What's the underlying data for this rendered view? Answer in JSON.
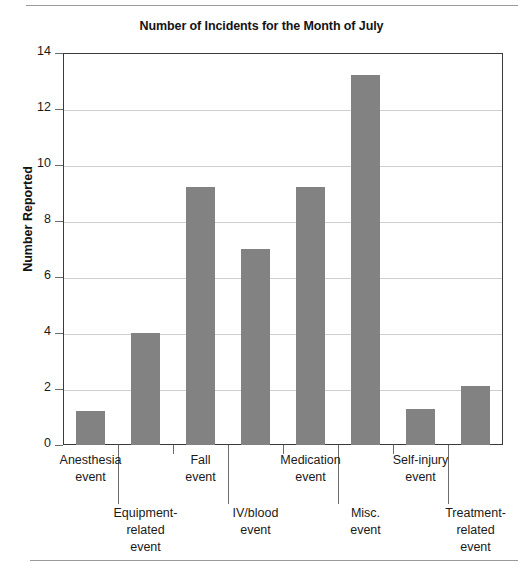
{
  "figure": {
    "title": "Number of Incidents for the Month of July",
    "y_axis_title": "Number Reported",
    "bar_color": "#828282",
    "grid_color": "#cfcfcf",
    "frame_color": "#3a3a3a"
  },
  "chart_data": {
    "type": "bar",
    "title": "Number of Incidents for the Month of July",
    "xlabel": "",
    "ylabel": "Number Reported",
    "ylim": [
      0,
      14
    ],
    "yticks": [
      0,
      2,
      4,
      6,
      8,
      10,
      12,
      14
    ],
    "ytick_labels": [
      "0",
      "2",
      "4",
      "6",
      "8",
      "10",
      "12",
      "14"
    ],
    "grid": true,
    "legend": false,
    "categories": [
      "Anesthesia\nevent",
      "Equipment-\nrelated\nevent",
      "Fall\nevent",
      "IV/blood\nevent",
      "Medication\nevent",
      "Misc.\nevent",
      "Self-injury\nevent",
      "Treatment-\nrelated\nevent"
    ],
    "values": [
      1.2,
      4,
      9.2,
      7,
      9.2,
      13.2,
      1.3,
      2.1
    ]
  }
}
